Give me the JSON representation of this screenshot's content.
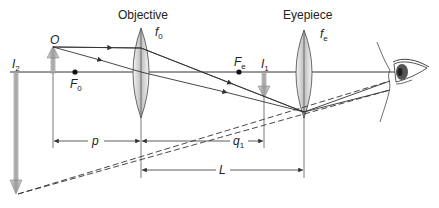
{
  "lenses": {
    "objective": {
      "label": "Objective",
      "focal_label": "f",
      "focal_sub": "0"
    },
    "eyepiece": {
      "label": "Eyepiece",
      "focal_label": "f",
      "focal_sub": "e"
    }
  },
  "points": {
    "object": {
      "label": "O"
    },
    "focal_objective": {
      "label": "F",
      "sub": "0"
    },
    "focal_eyepiece": {
      "label": "F",
      "sub": "e"
    },
    "image1": {
      "label": "I",
      "sub": "1"
    },
    "image2": {
      "label": "I",
      "sub": "2"
    }
  },
  "dimensions": {
    "p": {
      "label": "p"
    },
    "q1": {
      "label": "q",
      "sub": "1"
    },
    "L": {
      "label": "L"
    }
  },
  "colors": {
    "line": "#333333",
    "arrow_fill": "#bdbdbd",
    "lens_fill": "#d9d9d9"
  }
}
